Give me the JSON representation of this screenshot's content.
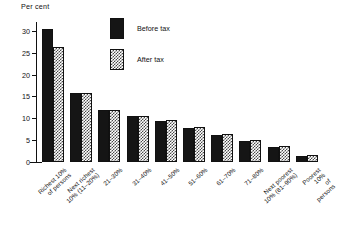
{
  "chart_data": {
    "type": "bar",
    "title": "",
    "xlabel": "",
    "ylabel": "Per cent",
    "ylim": [
      0,
      32
    ],
    "yticks": [
      0,
      5,
      10,
      15,
      20,
      25,
      30
    ],
    "grid": false,
    "legend_position": "top-center",
    "categories": [
      "Richest 10%\nof persons",
      "Next richest\n10% (11–20%)",
      "21–30%",
      "31–40%",
      "41–50%",
      "51–60%",
      "61–70%",
      "71–80%",
      "Next poorest\n10% (81–90%)",
      "Poorest 10%\nof persons"
    ],
    "series": [
      {
        "name": "Before tax",
        "color": "#151515",
        "values": [
          30.5,
          15.8,
          11.8,
          10.6,
          9.4,
          7.7,
          6.2,
          4.9,
          3.4,
          1.4
        ]
      },
      {
        "name": "After tax",
        "color": "#ffffff",
        "pattern": "dotted",
        "values": [
          26.4,
          15.8,
          11.8,
          10.6,
          9.6,
          8.1,
          6.5,
          5.1,
          3.7,
          1.6
        ]
      }
    ]
  },
  "legend": {
    "items": [
      {
        "label": "Before tax"
      },
      {
        "label": "After tax"
      }
    ]
  }
}
